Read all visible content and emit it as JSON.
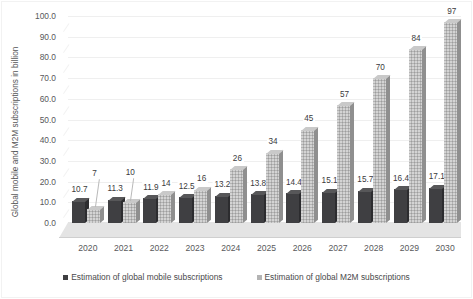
{
  "chart_data": {
    "type": "bar",
    "title": "",
    "subtitle": "",
    "xlabel": "",
    "ylabel": "Global mobile and M2M subscriptions in billion",
    "ylim": [
      0,
      100
    ],
    "yticks": [
      "0.0",
      "10.0",
      "20.0",
      "30.0",
      "40.0",
      "50.0",
      "60.0",
      "70.0",
      "80.0",
      "90.0",
      "100.0"
    ],
    "ytick_values": [
      0,
      10,
      20,
      30,
      40,
      50,
      60,
      70,
      80,
      90,
      100
    ],
    "grid": true,
    "legend_position": "bottom",
    "categories": [
      "2020",
      "2021",
      "2022",
      "2023",
      "2024",
      "2025",
      "2026",
      "2027",
      "2028",
      "2029",
      "2030"
    ],
    "series": [
      {
        "name": "Estimation of global mobile subscriptions",
        "color": "#3f3f42",
        "values": [
          10.7,
          11.3,
          11.9,
          12.5,
          13.2,
          13.8,
          14.4,
          15.1,
          15.7,
          16.4,
          17.1
        ],
        "labels": [
          "10.7",
          "11.3",
          "11.9",
          "12.5",
          "13.2",
          "13.8",
          "14.4",
          "15.1",
          "15.7",
          "16.4",
          "17.1"
        ]
      },
      {
        "name": "Estimation of global M2M subscriptions",
        "color": "#b4b4b4",
        "values": [
          7,
          10,
          14,
          16,
          26,
          34,
          45,
          57,
          70,
          84,
          97
        ],
        "labels": [
          "7",
          "10",
          "14",
          "16",
          "26",
          "34",
          "45",
          "57",
          "70",
          "84",
          "97"
        ]
      }
    ]
  }
}
